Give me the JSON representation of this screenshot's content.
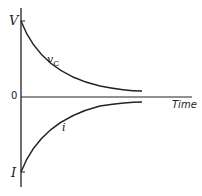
{
  "diagram": {
    "title": "",
    "labels": {
      "v_max": "V",
      "zero": "0",
      "i_min": "I",
      "time_axis": "Time",
      "vc_curve": "v",
      "vc_subscript": "C",
      "i_curve": "i"
    },
    "curves": [
      {
        "name": "vC",
        "description": "decays exponentially from V toward 0"
      },
      {
        "name": "i",
        "description": "rises exponentially from -I toward 0"
      }
    ],
    "colors": {
      "line": "#222222",
      "background": "#ffffff"
    }
  }
}
